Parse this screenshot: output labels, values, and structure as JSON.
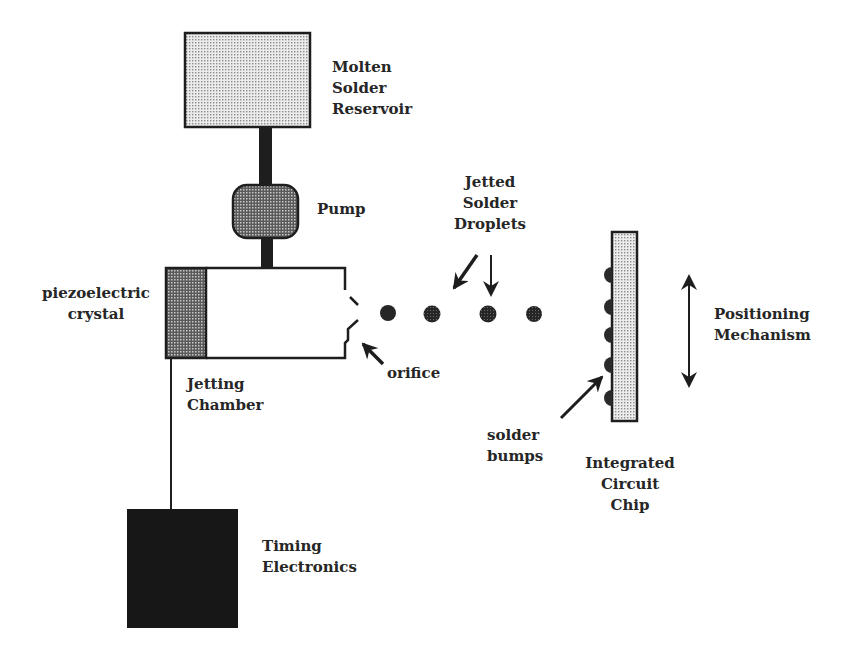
{
  "diagram": {
    "components": {
      "reservoir": {
        "label": "Molten\nSolder\nReservoir"
      },
      "pump": {
        "label": "Pump"
      },
      "crystal": {
        "label": "piezoelectric\ncrystal"
      },
      "chamber": {
        "label": "Jetting\nChamber"
      },
      "orifice": {
        "label": "orifice"
      },
      "droplets": {
        "label": "Jetted\nSolder\nDroplets",
        "count": 4
      },
      "chip": {
        "label": "Integrated\nCircuit\nChip"
      },
      "bumps": {
        "label": "solder\nbumps",
        "count": 5
      },
      "positioning": {
        "label": "Positioning\nMechanism"
      },
      "timing": {
        "label": "Timing\nElectronics"
      }
    },
    "colors": {
      "line": "#1e1e1e",
      "reservoir_fill": "#d6d6d6",
      "pump_fill": "#8a8a8a",
      "crystal_fill": "#8f8f8f",
      "chip_fill": "#d2d2d2",
      "timing_fill": "#171717",
      "droplet_fill": "#2a2a2a"
    }
  }
}
